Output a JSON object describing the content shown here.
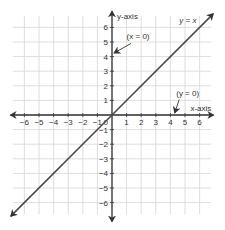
{
  "chart_data": {
    "type": "line",
    "title": "",
    "xlabel": "x-axis",
    "ylabel": "y-axis",
    "xlim": [
      -6.8,
      6.8
    ],
    "ylim": [
      -6.8,
      6.8
    ],
    "grid": true,
    "x_ticks": [
      -6,
      -5,
      -4,
      -3,
      -2,
      -1,
      0,
      1,
      2,
      3,
      4,
      5,
      6
    ],
    "y_ticks": [
      -6,
      -5,
      -4,
      -3,
      -2,
      -1,
      1,
      2,
      3,
      4,
      5,
      6
    ],
    "series": [
      {
        "name": "y = x",
        "x": [
          -7,
          7
        ],
        "y": [
          -7,
          7
        ]
      }
    ],
    "annotations": [
      {
        "text": "y = x",
        "x": 5.4,
        "y": 6.2
      },
      {
        "text": "(x = 0)",
        "x": 1.0,
        "y": 5.2,
        "points_to": "y-axis"
      },
      {
        "text": "(y = 0)",
        "x": 4.4,
        "y": 1.0,
        "points_to": "x-axis"
      }
    ]
  },
  "labels": {
    "x_axis": "x-axis",
    "y_axis": "y-axis",
    "line": "y = x",
    "x_zero": "(x = 0)",
    "y_zero": "(y = 0)",
    "origin": "0"
  },
  "colors": {
    "grid": "#d6d6d6",
    "axis": "#333333",
    "line": "#4a4a4a"
  }
}
